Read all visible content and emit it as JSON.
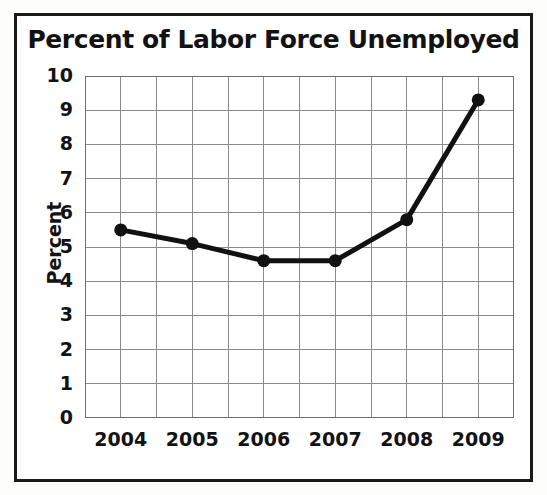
{
  "chart_data": {
    "type": "line",
    "title": "Percent of Labor Force Unemployed",
    "xlabel": "",
    "ylabel": "Percent",
    "categories": [
      "2004",
      "2005",
      "2006",
      "2007",
      "2008",
      "2009"
    ],
    "x": [
      2004,
      2005,
      2006,
      2007,
      2008,
      2009
    ],
    "values": [
      5.5,
      5.1,
      4.6,
      4.6,
      5.8,
      9.3
    ],
    "series": [
      {
        "name": "Percent of Labor Force Unemployed",
        "values": [
          5.5,
          5.1,
          4.6,
          4.6,
          5.8,
          9.3
        ]
      }
    ],
    "ylim": [
      0,
      10
    ],
    "xlim": [
      2003.5,
      2009.5
    ],
    "ytick_labels": [
      "10",
      "9",
      "8",
      "7",
      "6",
      "5",
      "4",
      "3",
      "2",
      "1",
      "0"
    ],
    "ytick_values": [
      10,
      9,
      8,
      7,
      6,
      5,
      4,
      3,
      2,
      1,
      0
    ],
    "xtick_labels": [
      "2004",
      "2005",
      "2006",
      "2007",
      "2008",
      "2009"
    ],
    "grid": true,
    "grid_x_interval": 0.5,
    "grid_y_interval": 1,
    "legend": false,
    "legend_position": "none",
    "marker": "circle",
    "line_color": "#111111",
    "marker_color": "#111111",
    "grid_color": "#8a8a8a",
    "axis_color": "#6e6e6e",
    "border_color": "#1a1a1a",
    "background_color": "#ffffff"
  }
}
